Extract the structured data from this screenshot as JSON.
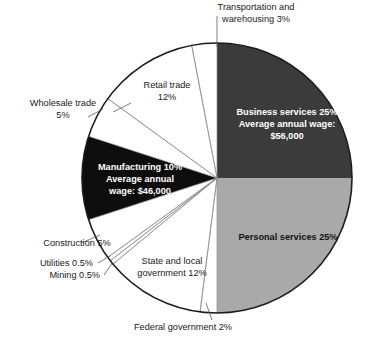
{
  "chart_data": {
    "type": "pie",
    "title": "",
    "subtitle": "",
    "xlabel": "",
    "ylabel": "",
    "legend_position": "none",
    "grid": false,
    "start_angle_deg": 0,
    "direction": "clockwise",
    "units": "percent",
    "total": 100,
    "center": {
      "cx": 217,
      "cy": 178,
      "r": 135
    },
    "categories": [
      "Business services",
      "Personal services",
      "Federal government",
      "State and local government",
      "Mining",
      "Utilities",
      "Construction",
      "Manufacturing",
      "Wholesale trade",
      "Retail trade",
      "Transportation and warehousing"
    ],
    "values": [
      25,
      25,
      2,
      12,
      0.5,
      0.5,
      5,
      10,
      5,
      12,
      3
    ],
    "colors": [
      "#3b3b3b",
      "#a9a9a9",
      "#ffffff",
      "#ffffff",
      "#ffffff",
      "#ffffff",
      "#ffffff",
      "#0d0d0d",
      "#ffffff",
      "#ffffff",
      "#ffffff"
    ],
    "slices": [
      {
        "name": "Business services",
        "value": 25,
        "value_label": "25%",
        "color": "#3b3b3b",
        "label_placement": "inside",
        "label_color": "#ffffff",
        "annotation": "Average annual wage: $56,000",
        "annual_wage": "$56,000",
        "start_deg": 0,
        "end_deg": 90
      },
      {
        "name": "Personal services",
        "value": 25,
        "value_label": "25%",
        "color": "#a9a9a9",
        "label_placement": "inside",
        "label_color": "#111111",
        "annotation": "",
        "start_deg": 90,
        "end_deg": 180
      },
      {
        "name": "Federal government",
        "value": 2,
        "value_label": "2%",
        "color": "#ffffff",
        "label_placement": "outside",
        "label_color": "#1a1a1a",
        "annotation": "",
        "start_deg": 180,
        "end_deg": 187.2
      },
      {
        "name": "State and local government",
        "value": 12,
        "value_label": "12%",
        "color": "#ffffff",
        "label_placement": "outside",
        "label_color": "#1a1a1a",
        "annotation": "",
        "start_deg": 187.2,
        "end_deg": 230.4
      },
      {
        "name": "Mining",
        "value": 0.5,
        "value_label": "0.5%",
        "color": "#ffffff",
        "label_placement": "outside",
        "label_color": "#1a1a1a",
        "annotation": "",
        "start_deg": 230.4,
        "end_deg": 232.2
      },
      {
        "name": "Utilities",
        "value": 0.5,
        "value_label": "0.5%",
        "color": "#ffffff",
        "label_placement": "outside",
        "label_color": "#1a1a1a",
        "annotation": "",
        "start_deg": 232.2,
        "end_deg": 234.0
      },
      {
        "name": "Construction",
        "value": 5,
        "value_label": "5%",
        "color": "#ffffff",
        "label_placement": "outside",
        "label_color": "#1a1a1a",
        "annotation": "",
        "start_deg": 234.0,
        "end_deg": 252.0
      },
      {
        "name": "Manufacturing",
        "value": 10,
        "value_label": "10%",
        "color": "#0d0d0d",
        "label_placement": "inside",
        "label_color": "#ffffff",
        "annotation": "Average annual wage: $46,000",
        "annual_wage": "$46,000",
        "start_deg": 252.0,
        "end_deg": 288.0
      },
      {
        "name": "Wholesale trade",
        "value": 5,
        "value_label": "5%",
        "color": "#ffffff",
        "label_placement": "outside",
        "label_color": "#1a1a1a",
        "annotation": "",
        "start_deg": 288.0,
        "end_deg": 306.0
      },
      {
        "name": "Retail trade",
        "value": 12,
        "value_label": "12%",
        "color": "#ffffff",
        "label_placement": "outside",
        "label_color": "#1a1a1a",
        "annotation": "",
        "start_deg": 306.0,
        "end_deg": 349.2
      },
      {
        "name": "Transportation and warehousing",
        "value": 3,
        "value_label": "3%",
        "color": "#ffffff",
        "label_placement": "outside",
        "label_color": "#1a1a1a",
        "annotation": "",
        "start_deg": 349.2,
        "end_deg": 360
      }
    ]
  },
  "labels": {
    "transportation_line1": "Transportation and",
    "transportation_line2": "warehousing 3%",
    "retail_line1": "Retail trade",
    "retail_line2": "12%",
    "wholesale_line1": "Wholesale trade",
    "wholesale_line2": "5%",
    "construction": "Construction 5%",
    "utilities": "Utilities 0.5%",
    "mining": "Mining 0.5%",
    "state_local_line1": "State and local",
    "state_local_line2": "government 12%",
    "federal": "Federal government 2%",
    "business_line1": "Business services 25%",
    "business_line2": "Average annual wage:",
    "business_line3": "$56,000",
    "personal_line1": "Personal services 25%",
    "manufacturing_line1": "Manufacturing 10%",
    "manufacturing_line2": "Average annual",
    "manufacturing_line3": "wage: $46,000"
  }
}
